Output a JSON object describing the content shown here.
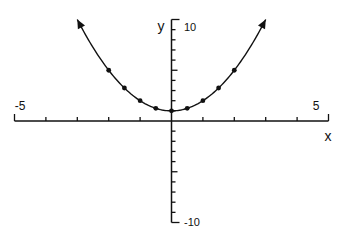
{
  "chart_data": {
    "type": "line",
    "title": "",
    "function": "y = x^2 + 1",
    "xlabel": "x",
    "ylabel": "y",
    "xlim": [
      -5,
      5
    ],
    "ylim": [
      -10,
      10
    ],
    "x_tick_step": 1,
    "y_tick_step": 1,
    "x_tick_labels": [
      {
        "value": -5,
        "label": "-5"
      },
      {
        "value": 5,
        "label": "5"
      }
    ],
    "y_tick_labels": [
      {
        "value": 10,
        "label": "10"
      },
      {
        "value": -10,
        "label": "-10"
      }
    ],
    "curve_domain": [
      -3,
      3
    ],
    "arrows_at_ends": true,
    "points": [
      {
        "x": -2,
        "y": 5
      },
      {
        "x": -1.5,
        "y": 3.25
      },
      {
        "x": -1,
        "y": 2
      },
      {
        "x": -0.5,
        "y": 1.25
      },
      {
        "x": 0,
        "y": 1
      },
      {
        "x": 0.5,
        "y": 1.25
      },
      {
        "x": 1,
        "y": 2
      },
      {
        "x": 1.5,
        "y": 3.25
      },
      {
        "x": 2,
        "y": 5
      }
    ],
    "grid": false,
    "color": "#111111"
  }
}
